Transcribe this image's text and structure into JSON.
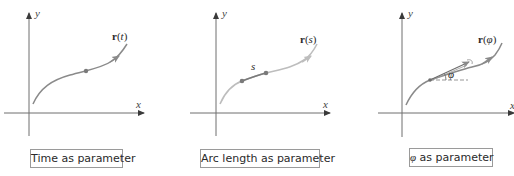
{
  "panels": [
    {
      "id": "time",
      "caption": "Time as parameter",
      "curve_label": "r(t)",
      "curve_label_bold": "r",
      "curve_label_arg": "t",
      "axis_x_label": "x",
      "axis_y_label": "y"
    },
    {
      "id": "arc-length",
      "caption": "Arc length as parameter",
      "curve_label": "r(s)",
      "curve_label_bold": "r",
      "curve_label_arg": "s",
      "segment_label": "s",
      "axis_x_label": "x",
      "axis_y_label": "y"
    },
    {
      "id": "angle",
      "caption_symbol": "φ",
      "caption": "as parameter",
      "curve_label": "r(φ)",
      "curve_label_bold": "r",
      "curve_label_arg": "φ",
      "angle_label": "φ",
      "axis_x_label": "x",
      "axis_y_label": "y"
    }
  ],
  "colors": {
    "axis": "#6e6e6e",
    "curve_dark": "#8a8a8a",
    "curve_light": "#bdbdbd",
    "dot": "#7a7a7a",
    "caption_border": "#9a9a9a",
    "text": "#2a2a2a"
  }
}
